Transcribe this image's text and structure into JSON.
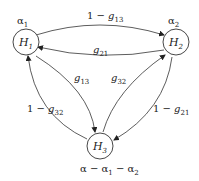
{
  "diagram": {
    "nodes": [
      {
        "id": "H1",
        "label": "H",
        "sub": "1",
        "weight": "α₁"
      },
      {
        "id": "H2",
        "label": "H",
        "sub": "2",
        "weight": "α₂"
      },
      {
        "id": "H3",
        "label": "H",
        "sub": "3",
        "weight": "α − α₁ − α₂"
      }
    ],
    "edges": [
      {
        "from": "H1",
        "to": "H2",
        "label": "1 − g13"
      },
      {
        "from": "H2",
        "to": "H1",
        "label": "g21"
      },
      {
        "from": "H1",
        "to": "H3",
        "label": "g13"
      },
      {
        "from": "H3",
        "to": "H1",
        "label": "1 − g32"
      },
      {
        "from": "H3",
        "to": "H2",
        "label": "g32"
      },
      {
        "from": "H2",
        "to": "H3",
        "label": "1 − g21"
      }
    ],
    "labels": {
      "alpha": "α",
      "one_minus": "1 − ",
      "g": "g",
      "minus": " − ",
      "H": "H",
      "s1": "1",
      "s2": "2",
      "s3": "3",
      "s13": "13",
      "s21": "21",
      "s32": "32"
    }
  }
}
